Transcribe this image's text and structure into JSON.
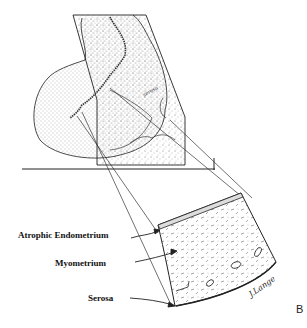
{
  "figure": {
    "panel_letter": "B",
    "labels": {
      "endometrium": "Atrophic Endometrium",
      "myometrium": "Myometrium",
      "serosa": "Serosa"
    },
    "signature": "J.Lange",
    "inset_note": "serosa"
  },
  "colors": {
    "line": "#222222",
    "stipple": "#555555",
    "background": "#ffffff"
  }
}
